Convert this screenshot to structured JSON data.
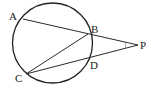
{
  "diagram": {
    "type": "geometry-circle-secants",
    "circle": {
      "cx": 52.5,
      "cy": 43,
      "r": 40
    },
    "points": {
      "A": {
        "label": "A",
        "x": 23,
        "y": 19
      },
      "B": {
        "label": "B",
        "x": 88,
        "y": 34
      },
      "C": {
        "label": "C",
        "x": 26,
        "y": 74
      },
      "D": {
        "label": "D",
        "x": 89,
        "y": 59
      },
      "P": {
        "label": "P",
        "x": 138,
        "y": 45
      }
    },
    "segments": [
      {
        "from": "A",
        "to": "P"
      },
      {
        "from": "C",
        "to": "P"
      },
      {
        "from": "C",
        "to": "B"
      }
    ],
    "angle_mark": {
      "vertex": "P",
      "between": [
        "A",
        "C"
      ]
    }
  }
}
